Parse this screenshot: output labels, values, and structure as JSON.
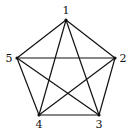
{
  "diagram": {
    "type": "complete-graph-K5",
    "stroke_color": "#111111",
    "vertices": [
      {
        "id": "1",
        "label": "1",
        "x": 66,
        "y": 20,
        "lx": 66,
        "ly": 14
      },
      {
        "id": "2",
        "label": "2",
        "x": 115,
        "y": 58,
        "lx": 123,
        "ly": 62
      },
      {
        "id": "3",
        "label": "3",
        "x": 99,
        "y": 115,
        "lx": 99,
        "ly": 128
      },
      {
        "id": "4",
        "label": "4",
        "x": 39,
        "y": 115,
        "lx": 39,
        "ly": 128
      },
      {
        "id": "5",
        "label": "5",
        "x": 17,
        "y": 58,
        "lx": 9,
        "ly": 62
      }
    ],
    "edges": [
      [
        "1",
        "2"
      ],
      [
        "1",
        "3"
      ],
      [
        "1",
        "4"
      ],
      [
        "1",
        "5"
      ],
      [
        "2",
        "3"
      ],
      [
        "2",
        "4"
      ],
      [
        "2",
        "5"
      ],
      [
        "3",
        "4"
      ],
      [
        "3",
        "5"
      ],
      [
        "4",
        "5"
      ]
    ]
  }
}
